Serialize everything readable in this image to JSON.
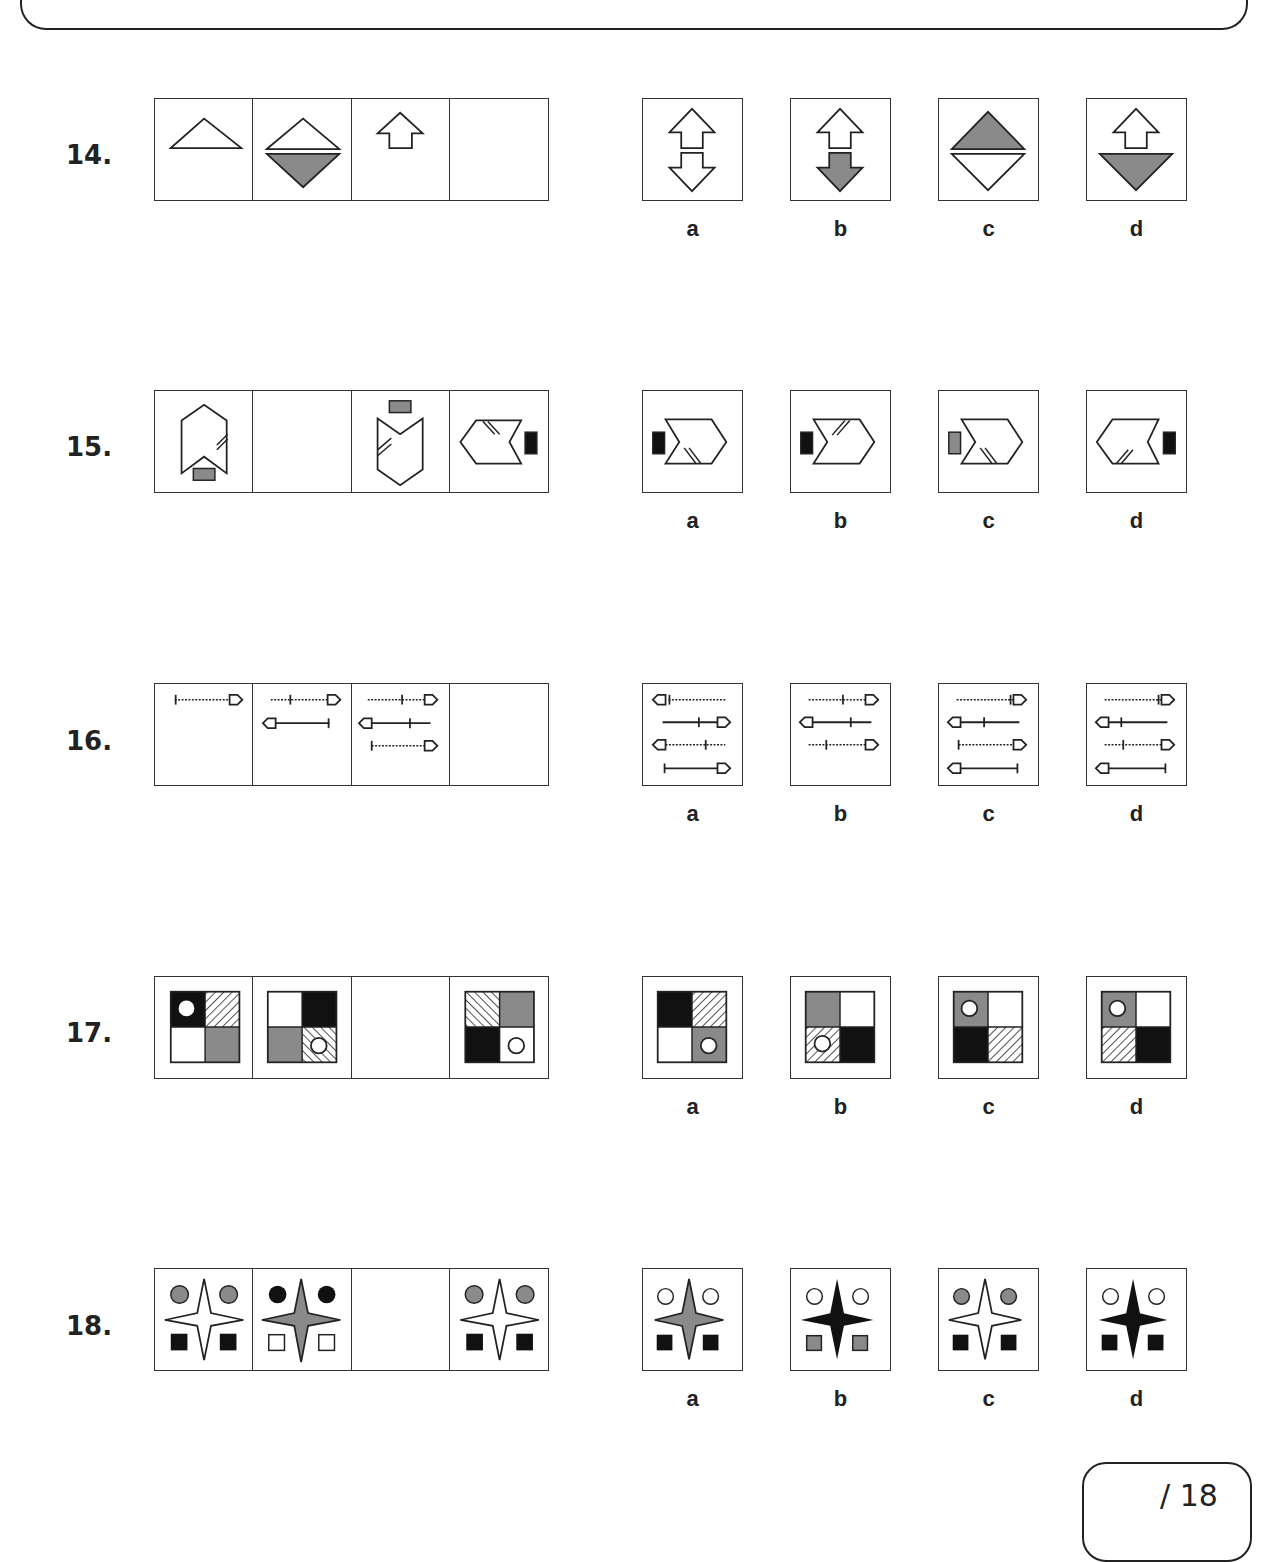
{
  "page": {
    "score_label": "/ 18"
  },
  "colors": {
    "grey": "#8a8a8a",
    "black": "#111111",
    "outline": "#222222"
  },
  "questions": [
    {
      "number": "14.",
      "sequence": [
        "white-triangle-up",
        "white-triangle-up-over-grey-triangle-down",
        "white-arrow-up",
        "blank"
      ],
      "options": [
        {
          "label": "a",
          "figure": "white-arrow-up-over-white-arrow-down"
        },
        {
          "label": "b",
          "figure": "white-arrow-up-over-grey-arrow-down"
        },
        {
          "label": "c",
          "figure": "grey-triangle-up-over-white-triangle-down"
        },
        {
          "label": "d",
          "figure": "white-arrow-up-over-grey-triangle-down"
        }
      ]
    },
    {
      "number": "15.",
      "sequence": [
        "pentagon-notch-up-grey-bar-bottom",
        "blank",
        "pentagon-notch-top-grey-bar-top",
        "pentagon-left-black-bar-right"
      ],
      "options": [
        {
          "label": "a",
          "figure": "pentagon-right-black-bar-left-marks-bottom"
        },
        {
          "label": "b",
          "figure": "pentagon-right-black-bar-left-marks-top"
        },
        {
          "label": "c",
          "figure": "pentagon-right-grey-bar-left-marks-bottom"
        },
        {
          "label": "d",
          "figure": "pentagon-left-black-bar-right-marks-bottom"
        }
      ]
    },
    {
      "number": "16.",
      "sequence": [
        "one-line",
        "two-lines",
        "three-lines",
        "blank"
      ],
      "options": [
        {
          "label": "a",
          "figure": "four-lines-variant-a"
        },
        {
          "label": "b",
          "figure": "three-lines-variant-b"
        },
        {
          "label": "c",
          "figure": "four-lines-variant-c"
        },
        {
          "label": "d",
          "figure": "four-lines-variant-d"
        }
      ]
    },
    {
      "number": "17.",
      "sequence": [
        "quad-black-circle-hatch-white-grey",
        "quad-white-black-grey-hatch-circle",
        "blank",
        "quad-hatch-grey-black-white-circle"
      ],
      "options": [
        {
          "label": "a",
          "figure": "quad-black-hatch-white-grey-circle"
        },
        {
          "label": "b",
          "figure": "quad-grey-white-hatch-circle-black"
        },
        {
          "label": "c",
          "figure": "quad-grey-circle-white-black-hatch"
        },
        {
          "label": "d",
          "figure": "quad-grey-circle-white-hatch-black"
        }
      ]
    },
    {
      "number": "18.",
      "sequence": [
        "white-star-grey-circles-black-squares",
        "grey-star-black-circles-white-squares",
        "blank",
        "white-star-grey-circles-black-squares"
      ],
      "options": [
        {
          "label": "a",
          "figure": "grey-star-white-circles-black-squares"
        },
        {
          "label": "b",
          "figure": "black-star-white-circles-grey-squares"
        },
        {
          "label": "c",
          "figure": "white-star-grey-circles-black-squares"
        },
        {
          "label": "d",
          "figure": "black-star-white-circles-black-squares"
        }
      ]
    }
  ]
}
